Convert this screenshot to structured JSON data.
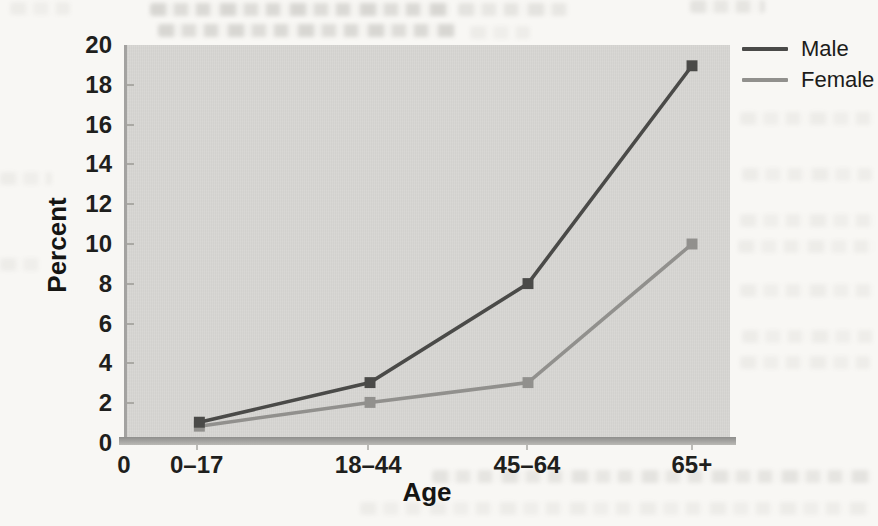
{
  "chart_data": {
    "type": "line",
    "title": "",
    "xlabel": "Age",
    "ylabel": "Percent",
    "x_origin_label": "0",
    "categories": [
      "0–17",
      "18–44",
      "45–64",
      "65+"
    ],
    "yticks": [
      0,
      2,
      4,
      6,
      8,
      10,
      12,
      14,
      16,
      18,
      20
    ],
    "ylim": [
      0,
      20
    ],
    "grid": false,
    "legend_position": "top-right",
    "marker": "square",
    "plot_background": "#d7d6d3",
    "series": [
      {
        "name": "Male",
        "color": "#4a4a48",
        "values": [
          1,
          3,
          8,
          19
        ]
      },
      {
        "name": "Female",
        "color": "#91908d",
        "values": [
          0.8,
          2,
          3,
          10
        ]
      }
    ]
  }
}
